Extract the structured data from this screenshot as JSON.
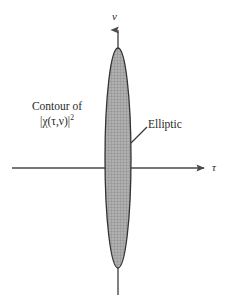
{
  "figure": {
    "background_color": "#ffffff",
    "width": 227,
    "height": 307
  },
  "axes": {
    "vertical": {
      "label": "ν",
      "name": "nu",
      "orientation": "vertical",
      "arrow": "up",
      "color": "#4a4a4a",
      "x": 118,
      "y_top": 25,
      "y_bottom": 295
    },
    "horizontal": {
      "label": "τ",
      "name": "tau",
      "orientation": "horizontal",
      "arrow": "right",
      "color": "#4a4a4a",
      "y": 168,
      "x_left": 12,
      "x_right": 208
    }
  },
  "annotations": {
    "contour_caption": {
      "line1": "Contour of",
      "line2_body": "|χ(τ,ν)|",
      "line2_exponent": "2"
    },
    "elliptic": {
      "label": "Elliptic",
      "leader_from_x": 131,
      "leader_from_y": 143,
      "leader_to_x": 147,
      "leader_to_y": 127
    }
  },
  "chart_data": {
    "type": "contour",
    "xlabel": "τ",
    "ylabel": "ν",
    "shape": "ellipse",
    "shape_description": "Elliptic",
    "grid": false,
    "legend": null,
    "center": {
      "x": 0,
      "y": 0
    },
    "semi_axis_tau": 13,
    "semi_axis_nu": 110,
    "eccentricity_note": "highly elongated along the nu (Doppler) axis",
    "fill": "gray crosshatch",
    "fill_color": "#a3a3a3",
    "outline_color": "#333333",
    "pixel_bounds": {
      "left": 105,
      "right": 131,
      "top": 48,
      "bottom": 268,
      "center_x": 118,
      "center_y": 158
    },
    "annotations": [
      "Contour of |χ(τ,ν)|²",
      "Elliptic"
    ]
  }
}
